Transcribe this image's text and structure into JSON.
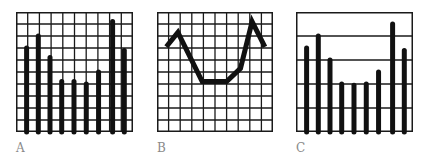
{
  "panels": [
    {
      "id": "A",
      "label": "A",
      "left": 16,
      "style": "bar-grid",
      "rows": 10,
      "cols": 10
    },
    {
      "id": "B",
      "label": "B",
      "left": 157,
      "style": "line-grid",
      "rows": 10,
      "cols": 10
    },
    {
      "id": "C",
      "label": "C",
      "left": 296,
      "style": "bar-bands",
      "rows": 5,
      "cols": 0
    }
  ],
  "colors": {
    "ink": "#111111",
    "grid": "#1a1a1a",
    "label": "#8a8a8a"
  },
  "chart_data": [
    {
      "type": "bar",
      "title": "A",
      "categories": [
        "1",
        "2",
        "3",
        "4",
        "5",
        "6",
        "7",
        "8",
        "9"
      ],
      "values": [
        7.0,
        8.0,
        6.2,
        4.2,
        4.2,
        4.0,
        5.0,
        9.2,
        6.8
      ],
      "ylim": [
        0,
        10
      ],
      "grid": "dense (10x10)",
      "xlabel": "",
      "ylabel": ""
    },
    {
      "type": "line",
      "title": "B",
      "x": [
        0.8,
        1.8,
        3.9,
        6.0,
        7.2,
        8.2,
        9.3
      ],
      "values": [
        7.1,
        8.3,
        4.2,
        4.2,
        5.3,
        9.2,
        7.1
      ],
      "xlim": [
        0,
        10
      ],
      "ylim": [
        0,
        10
      ],
      "grid": "dense (10x10)",
      "xlabel": "",
      "ylabel": ""
    },
    {
      "type": "bar",
      "title": "C",
      "categories": [
        "1",
        "2",
        "3",
        "4",
        "5",
        "6",
        "7",
        "8",
        "9"
      ],
      "values": [
        7.0,
        8.0,
        6.0,
        4.0,
        3.9,
        4.0,
        5.0,
        9.0,
        6.8
      ],
      "ylim": [
        0,
        10
      ],
      "grid": "horizontal only (5 bands)",
      "xlabel": "",
      "ylabel": ""
    }
  ]
}
